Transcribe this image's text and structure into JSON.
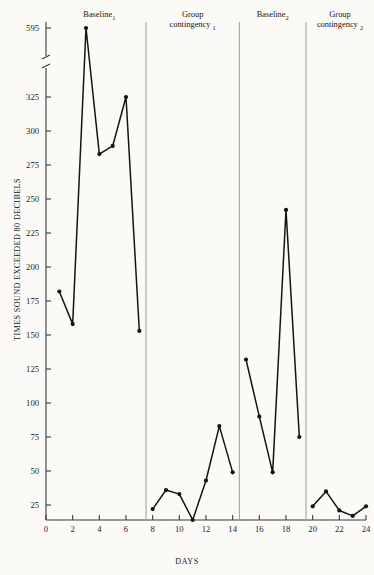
{
  "chart_data": {
    "type": "line",
    "title": "",
    "xlabel": "DAYS",
    "ylabel": "TIMES SOUND EXCEEDED 80 DECIBELS",
    "xlim": [
      0,
      24
    ],
    "ylim": [
      0,
      595
    ],
    "grid": false,
    "legend": "none",
    "axis_break": {
      "between": [
        325,
        595
      ],
      "note": "y-axis broken above 325"
    },
    "y_ticks": [
      25,
      50,
      75,
      100,
      125,
      150,
      175,
      200,
      225,
      250,
      275,
      300,
      325,
      595
    ],
    "x_ticks": [
      0,
      2,
      4,
      6,
      8,
      10,
      12,
      14,
      16,
      18,
      20,
      22,
      24
    ],
    "marker": "filled-circle",
    "line_color": "#141414",
    "phase_dividers": [
      7.5,
      14.5,
      19.5
    ],
    "phases": [
      {
        "name": "Baseline",
        "subscript": "1",
        "label": "Baseline₁",
        "x_start": 0.5,
        "x_end": 7.5
      },
      {
        "name": "Group contingency",
        "subscript": "1",
        "label": "Group contingency₁",
        "x_start": 7.5,
        "x_end": 14.5
      },
      {
        "name": "Baseline",
        "subscript": "2",
        "label": "Baseline₂",
        "x_start": 14.5,
        "x_end": 19.5
      },
      {
        "name": "Group contingency",
        "subscript": "2",
        "label": "Group contingency₂",
        "x_start": 19.5,
        "x_end": 24.5
      }
    ],
    "series": [
      {
        "name": "Baseline 1",
        "x": [
          1,
          2,
          3,
          4,
          5,
          6,
          7
        ],
        "values": [
          182,
          158,
          595,
          283,
          289,
          325,
          153
        ]
      },
      {
        "name": "Group contingency 1",
        "x": [
          8,
          9,
          10,
          11,
          12,
          13,
          14
        ],
        "values": [
          22,
          36,
          33,
          14,
          43,
          83,
          49
        ]
      },
      {
        "name": "Baseline 2",
        "x": [
          15,
          16,
          17,
          18,
          19
        ],
        "values": [
          132,
          90,
          49,
          242,
          75
        ]
      },
      {
        "name": "Group contingency 2",
        "x": [
          20,
          21,
          22,
          23,
          24
        ],
        "values": [
          24,
          35,
          21,
          17,
          24
        ]
      }
    ]
  },
  "axis": {
    "y_title": "TIMES SOUND EXCEEDED 80 DECIBELS",
    "x_title": "DAYS",
    "y_tick_labels": [
      "595",
      "325",
      "300",
      "275",
      "250",
      "225",
      "200",
      "175",
      "150",
      "125",
      "100",
      "75",
      "50",
      "25"
    ],
    "x_tick_labels": [
      "0",
      "2",
      "4",
      "6",
      "8",
      "10",
      "12",
      "14",
      "16",
      "18",
      "20",
      "22",
      "24"
    ]
  },
  "phase_headers": [
    {
      "text": "Baseline",
      "sub": "1"
    },
    {
      "text": "Group",
      "text2": "contingency",
      "sub": "1"
    },
    {
      "text": "Baseline",
      "sub": "2"
    },
    {
      "text": "Group",
      "text2": "contingency",
      "sub": "2"
    }
  ],
  "colors": {
    "background": "#fbfaf7",
    "ink": "#141414",
    "divider": "#9a9a9a"
  }
}
